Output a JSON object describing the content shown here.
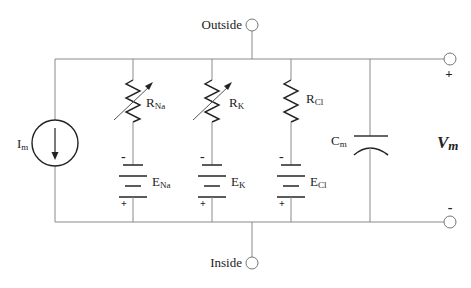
{
  "diagram": {
    "terminals": {
      "outside": "Outside",
      "inside": "Inside",
      "plus": "+",
      "minus": "-"
    },
    "current_source": {
      "label": "I",
      "sub": "m"
    },
    "branches": [
      {
        "resistor": "R",
        "resistor_sub": "Na",
        "variable": true,
        "battery": "E",
        "battery_sub": "Na",
        "neg": "-",
        "pos": "+"
      },
      {
        "resistor": "R",
        "resistor_sub": "K",
        "variable": true,
        "battery": "E",
        "battery_sub": "K",
        "neg": "-",
        "pos": "+"
      },
      {
        "resistor": "R",
        "resistor_sub": "Cl",
        "variable": false,
        "battery": "E",
        "battery_sub": "Cl",
        "neg": "-",
        "pos": "+"
      }
    ],
    "capacitor": {
      "label": "C",
      "sub": "m"
    },
    "voltage": {
      "label": "V",
      "sub": "m"
    },
    "colors": {
      "wire": "#8a8a8a",
      "component": "#222222",
      "background": "#ffffff"
    }
  }
}
